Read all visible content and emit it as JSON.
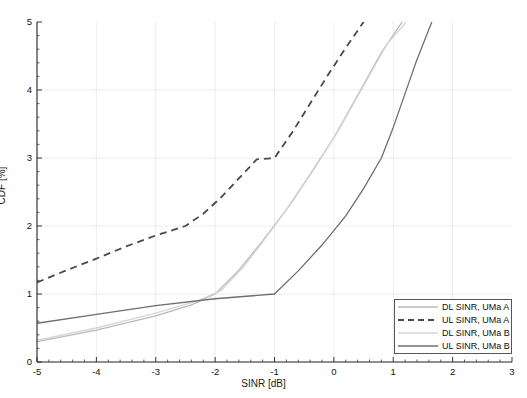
{
  "figure": {
    "width": 527,
    "height": 398,
    "background": "#ffffff"
  },
  "axes": {
    "xlabel": "SINR [dB]",
    "ylabel": "CDF [%]",
    "x_ticks": [
      "-5",
      "-4",
      "-3",
      "-2",
      "-1",
      "0",
      "1",
      "2",
      "3"
    ],
    "y_ticks": [
      "0",
      "1",
      "2",
      "3",
      "4",
      "5"
    ]
  },
  "legend": {
    "items": [
      {
        "label": "DL SINR, UMa A",
        "style": "solid",
        "color": "#b9b9b9"
      },
      {
        "label": "UL SINR,  UMa A",
        "style": "dashed",
        "color": "#4a4a4a"
      },
      {
        "label": "DL SINR, UMa B",
        "style": "solid",
        "color": "#d6d6d6"
      },
      {
        "label": "UL SINR,  UMa B",
        "style": "solid",
        "color": "#6e6e6e"
      }
    ]
  },
  "chart_data": {
    "type": "line",
    "title": "",
    "xlabel": "SINR [dB]",
    "ylabel": "CDF [%]",
    "xlim": [
      -5,
      3
    ],
    "ylim": [
      0,
      5
    ],
    "grid": true,
    "legend_position": "lower right",
    "series": [
      {
        "name": "DL SINR, UMa A",
        "style": "solid",
        "color": "#b9b9b9",
        "points": [
          [
            -5,
            0.3
          ],
          [
            -4,
            0.47
          ],
          [
            -3,
            0.68
          ],
          [
            -2.4,
            0.84
          ],
          [
            -2.0,
            1.0
          ],
          [
            -1.6,
            1.35
          ],
          [
            -1.2,
            1.78
          ],
          [
            -0.8,
            2.24
          ],
          [
            -0.4,
            2.76
          ],
          [
            0.0,
            3.3
          ],
          [
            0.4,
            3.92
          ],
          [
            0.8,
            4.55
          ],
          [
            1.15,
            5.0
          ]
        ]
      },
      {
        "name": "UL SINR,  UMa A",
        "style": "dashed",
        "color": "#4a4a4a",
        "points": [
          [
            -5,
            1.17
          ],
          [
            -4.5,
            1.35
          ],
          [
            -4,
            1.52
          ],
          [
            -3.5,
            1.7
          ],
          [
            -3,
            1.86
          ],
          [
            -2.5,
            2.0
          ],
          [
            -2.2,
            2.18
          ],
          [
            -1.9,
            2.42
          ],
          [
            -1.6,
            2.7
          ],
          [
            -1.3,
            2.98
          ],
          [
            -1.0,
            3.0
          ],
          [
            -0.7,
            3.38
          ],
          [
            -0.4,
            3.8
          ],
          [
            -0.1,
            4.22
          ],
          [
            0.2,
            4.62
          ],
          [
            0.5,
            5.0
          ]
        ]
      },
      {
        "name": "DL SINR, UMa B",
        "style": "solid",
        "color": "#d6d6d6",
        "points": [
          [
            -5,
            0.32
          ],
          [
            -4,
            0.5
          ],
          [
            -3,
            0.72
          ],
          [
            -2.3,
            0.9
          ],
          [
            -1.9,
            1.05
          ],
          [
            -1.5,
            1.42
          ],
          [
            -1.1,
            1.88
          ],
          [
            -0.7,
            2.36
          ],
          [
            -0.3,
            2.88
          ],
          [
            0.1,
            3.44
          ],
          [
            0.5,
            4.06
          ],
          [
            0.9,
            4.68
          ],
          [
            1.22,
            5.0
          ]
        ]
      },
      {
        "name": "UL SINR,  UMa B",
        "style": "solid",
        "color": "#6e6e6e",
        "points": [
          [
            -5,
            0.57
          ],
          [
            -4,
            0.7
          ],
          [
            -3,
            0.83
          ],
          [
            -2,
            0.93
          ],
          [
            -1,
            1.0
          ],
          [
            -0.6,
            1.34
          ],
          [
            -0.2,
            1.72
          ],
          [
            0.2,
            2.15
          ],
          [
            0.5,
            2.55
          ],
          [
            0.8,
            3.0
          ],
          [
            1.0,
            3.45
          ],
          [
            1.2,
            3.95
          ],
          [
            1.4,
            4.45
          ],
          [
            1.65,
            5.0
          ]
        ]
      }
    ]
  }
}
